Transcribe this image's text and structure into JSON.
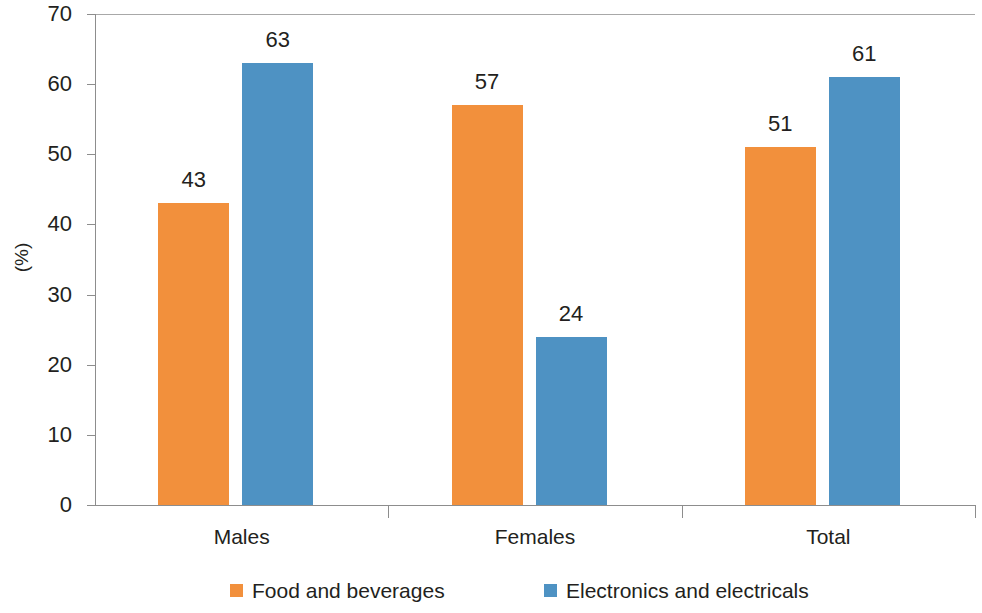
{
  "chart_data": {
    "type": "bar",
    "title": "",
    "subtitle": "",
    "xlabel": "",
    "ylabel": "(%)",
    "ylim": [
      0,
      70
    ],
    "ytick_step": 10,
    "yticks": [
      0,
      10,
      20,
      30,
      40,
      50,
      60,
      70
    ],
    "grid": false,
    "legend_position": "bottom",
    "categories": [
      "Males",
      "Females",
      "Total"
    ],
    "series": [
      {
        "name": "Food and beverages",
        "color": "#f2903c",
        "values": [
          43,
          57,
          51
        ]
      },
      {
        "name": "Electronics and electricals",
        "color": "#4e92c3",
        "values": [
          63,
          24,
          61
        ]
      }
    ],
    "data_labels": [
      [
        "43",
        "57",
        "51"
      ],
      [
        "63",
        "24",
        "61"
      ]
    ]
  },
  "axis": {
    "y_title": "(%)",
    "y_tick_labels": [
      "70",
      "60",
      "50",
      "40",
      "30",
      "20",
      "10",
      "0"
    ],
    "x_tick_labels": [
      "Males",
      "Females",
      "Total"
    ]
  },
  "legend": {
    "items": [
      {
        "label": "Food and beverages",
        "color": "#f2903c"
      },
      {
        "label": "Electronics and electricals",
        "color": "#4e92c3"
      }
    ]
  }
}
